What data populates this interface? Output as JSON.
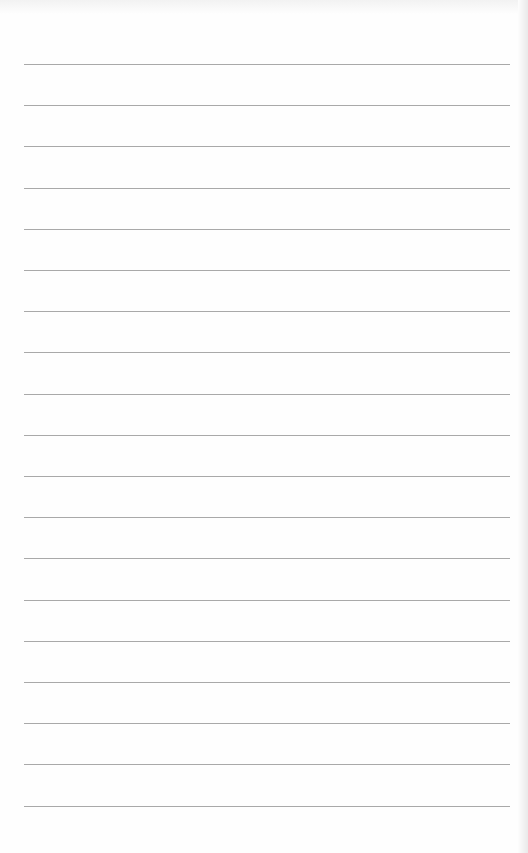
{
  "document": {
    "type": "lined-paper",
    "line_count": 19,
    "line_color": "#9a9a9a",
    "background": "#fefefe",
    "first_line_y": 64,
    "line_spacing": 41.2,
    "line_left": 24,
    "line_right": 510
  }
}
